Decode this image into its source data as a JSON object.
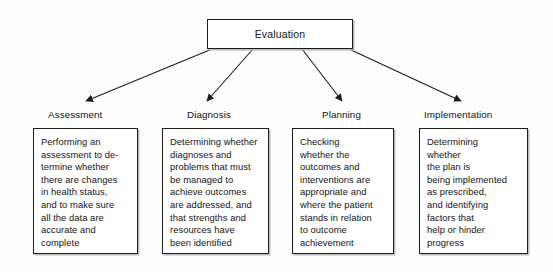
{
  "diagram": {
    "type": "flowchart",
    "orientation": "top-down",
    "root": {
      "label": "Evaluation"
    },
    "branches": [
      {
        "id": "assessment",
        "label": "Assessment",
        "detail": "Performing an\nassessment to de-\ntermine whether\nthere are changes\nin health status,\nand to make sure\nall the data are\naccurate and\ncomplete"
      },
      {
        "id": "diagnosis",
        "label": "Diagnosis",
        "detail": "Determining whether\ndiagnoses and\nproblems that must\nbe managed to\nachieve outcomes\nare addressed, and\nthat strengths and\nresources have\nbeen identified"
      },
      {
        "id": "planning",
        "label": "Planning",
        "detail": "Checking\nwhether the\noutcomes and\ninterventions are\nappropriate and\nwhere the patient\nstands in relation\nto outcome\nachievement"
      },
      {
        "id": "implementation",
        "label": "Implementation",
        "detail": "Determining\nwhether\nthe plan is\nbeing implemented\nas prescribed,\nand identifying\nfactors that\nhelp or hinder\nprogress"
      }
    ],
    "colors": {
      "background": "#fdfdfd",
      "stroke": "#1d1d1d",
      "text": "#141414",
      "shadow": "#bcbcbc"
    }
  }
}
